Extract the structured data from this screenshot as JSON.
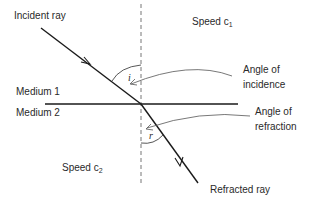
{
  "diagram": {
    "labels": {
      "incident_ray": "Incident ray",
      "refracted_ray": "Refracted ray",
      "medium_1": "Medium 1",
      "medium_2": "Medium 2",
      "speed_1_prefix": "Speed c",
      "speed_1_sub": "1",
      "speed_2_prefix": "Speed c",
      "speed_2_sub": "2",
      "angle_incidence_line1": "Angle of",
      "angle_incidence_line2": "incidence",
      "angle_refraction_line1": "Angle of",
      "angle_refraction_line2": "refraction",
      "angle_i_symbol": "i",
      "angle_r_symbol": "r"
    },
    "colors": {
      "line": "#1a1a1a",
      "normal": "#666666",
      "pointer": "#555555",
      "text": "#2a2a2a",
      "background": "#ffffff"
    }
  }
}
